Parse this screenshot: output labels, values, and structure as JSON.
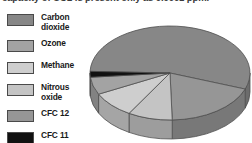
{
  "caption": {
    "text": "capacity of CO2 is present only as 0.0001 ppm."
  },
  "legend": {
    "items": [
      {
        "label": "Carbon\ndioxide",
        "color": "#878787",
        "name": "carbon-dioxide"
      },
      {
        "label": "Ozone",
        "color": "#a3a3a3",
        "name": "ozone"
      },
      {
        "label": "Methane",
        "color": "#cecece",
        "name": "methane"
      },
      {
        "label": "Nitrous\noxide",
        "color": "#c4c4c4",
        "name": "nitrous-oxide"
      },
      {
        "label": "CFC 12",
        "color": "#969696",
        "name": "cfc-12"
      },
      {
        "label": "CFC 11",
        "color": "#111111",
        "name": "cfc-11"
      }
    ]
  },
  "chart_data": {
    "type": "pie",
    "title": "",
    "style": "3d-exploded-disc",
    "categories": [
      "Carbon dioxide",
      "CFC 12",
      "Nitrous oxide",
      "Methane",
      "Ozone",
      "CFC 11"
    ],
    "values": [
      55,
      19,
      9,
      9,
      6,
      2
    ],
    "unit": "%",
    "colors": [
      "#878787",
      "#969696",
      "#c4c4c4",
      "#cecece",
      "#a3a3a3",
      "#111111"
    ],
    "legend_position": "left",
    "grid": false,
    "labels_shown": false,
    "geometry": {
      "center_x": 84,
      "center_y": 53,
      "radius_x": 80,
      "radius_y": 47,
      "depth": 19,
      "start_angle_deg": 182
    }
  }
}
